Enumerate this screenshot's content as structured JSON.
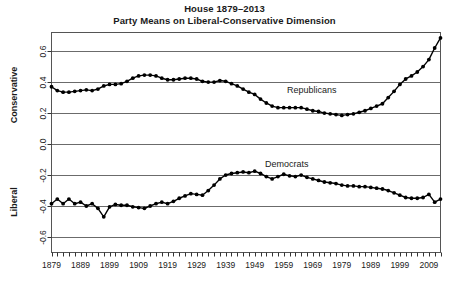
{
  "title": {
    "line1": "House 1879–2013",
    "line2": "Party Means on Liberal-Conservative Dimension"
  },
  "axes": {
    "y_label_top": "Conservative",
    "y_label_bottom": "Liberal",
    "y_ticks": [
      "0.6",
      "0.4",
      "0.2",
      "0.0",
      "-0.2",
      "-0.4",
      "-0.6"
    ],
    "y_tick_values": [
      0.6,
      0.4,
      0.2,
      0.0,
      -0.2,
      -0.4,
      -0.6
    ],
    "x_ticks": [
      "1879",
      "1889",
      "1899",
      "1909",
      "1919",
      "1929",
      "1939",
      "1949",
      "1959",
      "1969",
      "1979",
      "1989",
      "1999",
      "2009"
    ],
    "x_tick_values": [
      1879,
      1889,
      1899,
      1909,
      1919,
      1929,
      1939,
      1949,
      1959,
      1969,
      1979,
      1989,
      1999,
      2009
    ]
  },
  "annotations": {
    "republicans": "Republicans",
    "democrats": "Democrats"
  },
  "chart_data": {
    "type": "line",
    "subtitle": "Party Means on Liberal-Conservative Dimension",
    "xlabel": "",
    "ylabel": "Liberal – Conservative",
    "xlim": [
      1879,
      2013
    ],
    "ylim": [
      -0.7,
      0.72
    ],
    "grid": "horizontal",
    "legend": "inline-annotations",
    "marker": "filled-circle",
    "x": [
      1879,
      1881,
      1883,
      1885,
      1887,
      1889,
      1891,
      1893,
      1895,
      1897,
      1899,
      1901,
      1903,
      1905,
      1907,
      1909,
      1911,
      1913,
      1915,
      1917,
      1919,
      1921,
      1923,
      1925,
      1927,
      1929,
      1931,
      1933,
      1935,
      1937,
      1939,
      1941,
      1943,
      1945,
      1947,
      1949,
      1951,
      1953,
      1955,
      1957,
      1959,
      1961,
      1963,
      1965,
      1967,
      1969,
      1971,
      1973,
      1975,
      1977,
      1979,
      1981,
      1983,
      1985,
      1987,
      1989,
      1991,
      1993,
      1995,
      1997,
      1999,
      2001,
      2003,
      2005,
      2007,
      2009,
      2011,
      2013
    ],
    "series": [
      {
        "name": "Republicans",
        "color": "#000000",
        "values": [
          0.37,
          0.345,
          0.335,
          0.335,
          0.34,
          0.345,
          0.35,
          0.345,
          0.355,
          0.375,
          0.385,
          0.385,
          0.39,
          0.405,
          0.425,
          0.44,
          0.445,
          0.445,
          0.44,
          0.425,
          0.415,
          0.415,
          0.42,
          0.425,
          0.425,
          0.42,
          0.405,
          0.4,
          0.4,
          0.41,
          0.405,
          0.39,
          0.375,
          0.355,
          0.335,
          0.32,
          0.29,
          0.265,
          0.245,
          0.235,
          0.235,
          0.235,
          0.235,
          0.235,
          0.225,
          0.215,
          0.21,
          0.2,
          0.195,
          0.19,
          0.185,
          0.19,
          0.195,
          0.205,
          0.215,
          0.23,
          0.245,
          0.26,
          0.3,
          0.34,
          0.385,
          0.42,
          0.44,
          0.465,
          0.5,
          0.545,
          0.62,
          0.685
        ]
      },
      {
        "name": "Democrats",
        "color": "#000000",
        "values": [
          -0.385,
          -0.355,
          -0.385,
          -0.355,
          -0.385,
          -0.375,
          -0.4,
          -0.385,
          -0.415,
          -0.47,
          -0.405,
          -0.39,
          -0.395,
          -0.395,
          -0.405,
          -0.41,
          -0.415,
          -0.4,
          -0.385,
          -0.375,
          -0.385,
          -0.37,
          -0.35,
          -0.335,
          -0.32,
          -0.325,
          -0.33,
          -0.3,
          -0.265,
          -0.225,
          -0.2,
          -0.19,
          -0.185,
          -0.18,
          -0.185,
          -0.175,
          -0.19,
          -0.21,
          -0.225,
          -0.21,
          -0.195,
          -0.205,
          -0.21,
          -0.2,
          -0.215,
          -0.225,
          -0.235,
          -0.245,
          -0.25,
          -0.255,
          -0.265,
          -0.27,
          -0.27,
          -0.275,
          -0.275,
          -0.28,
          -0.285,
          -0.29,
          -0.3,
          -0.315,
          -0.33,
          -0.345,
          -0.35,
          -0.35,
          -0.345,
          -0.325,
          -0.375,
          -0.355
        ]
      }
    ]
  }
}
